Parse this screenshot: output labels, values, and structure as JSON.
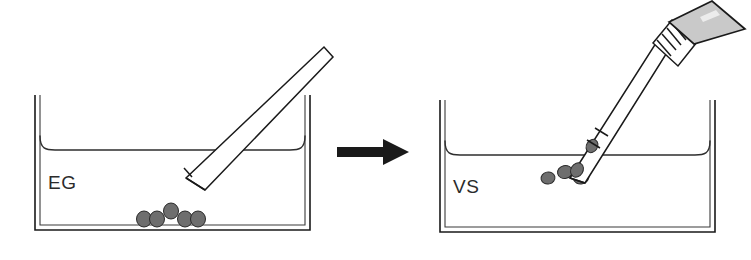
{
  "figure": {
    "width": 751,
    "height": 260,
    "background_color": "#ffffff"
  },
  "colors": {
    "outline": "#1a1a1a",
    "inner_wall": "#3a3a3a",
    "meniscus": "#2e2e2e",
    "pellet_fill": "#6e6e6e",
    "pellet_stroke": "#2a2a2a",
    "bulb_fill": "#c9c9c9",
    "arrow": "#1a1a1a",
    "label_text": "#2b2b2b",
    "white": "#ffffff"
  },
  "panels": [
    {
      "id": "left-panel",
      "name": "equilibration-dish-panel",
      "label": "EG",
      "label_meaning": "ethylene glycol equilibration solution",
      "dish": {
        "x": 35,
        "y": 95,
        "width": 275,
        "height": 135,
        "wall_gap": 4,
        "meniscus_y": 150,
        "meniscus_curve_radius": 14
      },
      "pipette": {
        "name": "transfer-pipette-empty",
        "angle_deg": -52,
        "tip_open": true,
        "has_bulb": false,
        "tip_x": 186,
        "tip_y": 184,
        "top_x": 320,
        "top_y": 55,
        "contents": []
      },
      "pellets": [
        {
          "cx": 144,
          "cy": 219,
          "rx": 7.5,
          "ry": 8.0
        },
        {
          "cx": 157,
          "cy": 219,
          "rx": 7.5,
          "ry": 8.0
        },
        {
          "cx": 171,
          "cy": 212,
          "rx": 7.5,
          "ry": 8.0
        },
        {
          "cx": 185,
          "cy": 219,
          "rx": 7.5,
          "ry": 8.0
        },
        {
          "cx": 198,
          "cy": 219,
          "rx": 7.5,
          "ry": 8.0
        }
      ],
      "pellet_count": 5
    },
    {
      "id": "right-panel",
      "name": "vitrification-dish-panel",
      "label": "VS",
      "label_meaning": "vitrification solution",
      "dish": {
        "x": 440,
        "y": 100,
        "width": 275,
        "height": 132,
        "wall_gap": 4,
        "meniscus_y": 155,
        "meniscus_curve_radius": 14
      },
      "pipette": {
        "name": "transfer-pipette-loaded",
        "angle_deg": -58,
        "tip_open": true,
        "has_bulb": true,
        "tip_x": 568,
        "tip_y": 170,
        "top_x": 740,
        "top_y": 6,
        "bulb_label": "gray-tapered-bulb",
        "grip_ribs": 6,
        "contents_count": 2
      },
      "pellets": [
        {
          "cx": 548,
          "cy": 177,
          "rx": 7.0,
          "ry": 6.0
        },
        {
          "cx": 565,
          "cy": 172,
          "rx": 7.5,
          "ry": 6.5
        },
        {
          "cx": 580,
          "cy": 176,
          "rx": 8.0,
          "ry": 7.0
        }
      ],
      "pellet_count": 3
    }
  ],
  "arrow": {
    "name": "process-arrow",
    "direction": "right",
    "x": 337,
    "y": 151,
    "length": 70,
    "shaft_thickness": 9,
    "head_width": 26,
    "head_height": 28
  }
}
